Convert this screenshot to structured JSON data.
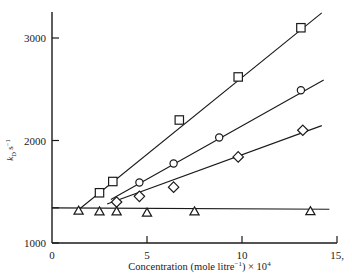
{
  "chart_data": {
    "type": "scatter",
    "title": "",
    "xlabel": "Concentration (mole litre⁻¹) × 10⁴",
    "ylabel": "k_D s⁻¹",
    "ylabel_parts": {
      "symbol": "k",
      "subscript": "D",
      "unit": "s",
      "unit_exp": "−1"
    },
    "xlim": [
      0,
      15
    ],
    "ylim": [
      1000,
      3150
    ],
    "xticks": [
      0,
      5,
      10,
      15
    ],
    "xtick_labels": [
      "0",
      "5",
      "10",
      "15,"
    ],
    "yticks": [
      1000,
      2000,
      3000
    ],
    "ytick_labels": [
      "1000",
      "2000",
      "3000"
    ],
    "extra_ytick": 1343,
    "grid": false,
    "legend": "none",
    "series": [
      {
        "name": "squares",
        "marker": "square",
        "points": [
          {
            "x": 2.5,
            "y": 1490
          },
          {
            "x": 3.2,
            "y": 1600
          },
          {
            "x": 6.7,
            "y": 2200
          },
          {
            "x": 9.8,
            "y": 2620
          },
          {
            "x": 13.1,
            "y": 3100
          }
        ],
        "fit_line": {
          "x0": 1.3,
          "y0": 1310,
          "x1": 14.2,
          "y1": 3245
        }
      },
      {
        "name": "circles",
        "marker": "circle",
        "points": [
          {
            "x": 4.6,
            "y": 1590
          },
          {
            "x": 6.4,
            "y": 1775
          },
          {
            "x": 8.8,
            "y": 2030
          },
          {
            "x": 13.1,
            "y": 2490
          }
        ],
        "fit_line": {
          "x0": 3.1,
          "y0": 1425,
          "x1": 14.3,
          "y1": 2590
        }
      },
      {
        "name": "diamonds",
        "marker": "diamond",
        "points": [
          {
            "x": 3.4,
            "y": 1400
          },
          {
            "x": 4.6,
            "y": 1455
          },
          {
            "x": 6.4,
            "y": 1545
          },
          {
            "x": 9.8,
            "y": 1840
          },
          {
            "x": 13.2,
            "y": 2100
          }
        ],
        "fit_line": {
          "x0": 2.9,
          "y0": 1380,
          "x1": 14.2,
          "y1": 2145
        }
      },
      {
        "name": "triangles",
        "marker": "triangle",
        "points": [
          {
            "x": 1.4,
            "y": 1315
          },
          {
            "x": 2.5,
            "y": 1308
          },
          {
            "x": 3.4,
            "y": 1308
          },
          {
            "x": 5.0,
            "y": 1295
          },
          {
            "x": 7.5,
            "y": 1308
          },
          {
            "x": 13.6,
            "y": 1310
          }
        ],
        "fit_line": {
          "x0": 0.0,
          "y0": 1343,
          "x1": 14.6,
          "y1": 1330
        }
      }
    ]
  },
  "axes": {
    "stroke_color": "#1a1a1a"
  }
}
